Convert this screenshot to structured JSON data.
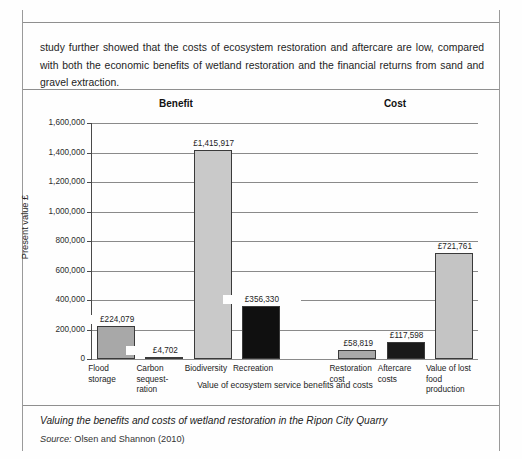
{
  "document": {
    "paragraph": "study further showed that the costs of ecosystem restoration and aftercare are low, compared with both the economic benefits of wetland restoration and the financial returns from sand and gravel extraction.",
    "caption": "Valuing the benefits and costs of wetland restoration in the Ripon City Quarry",
    "source_label": "Source:",
    "source_text": "Olsen and Shannon (2010)"
  },
  "chart_data": {
    "type": "bar",
    "title": "",
    "xlabel": "Value of ecosystem service benefits and costs",
    "ylabel": "Present value £",
    "ylim": [
      0,
      1600000
    ],
    "ytick_values": [
      0,
      200000,
      400000,
      600000,
      800000,
      1000000,
      1200000,
      1400000,
      1600000
    ],
    "ytick_labels": [
      "0",
      "200,000",
      "400,000",
      "600,000",
      "800,000",
      "1,000,000",
      "1,200,000",
      "1,400,000",
      "1,600,000"
    ],
    "grid": true,
    "legend": "none",
    "group_headings": [
      {
        "label": "Benefit"
      },
      {
        "label": "Cost"
      }
    ],
    "categories": [
      "Flood storage",
      "Carbon sequest-ration",
      "Biodiversity",
      "Recreation",
      "",
      "Restoration cost",
      "Aftercare costs",
      "Value of lost food production"
    ],
    "values": [
      224079,
      4702,
      1415917,
      356330,
      null,
      58819,
      117598,
      721761
    ],
    "bars": [
      {
        "category_lines": [
          "Flood",
          "storage"
        ],
        "value": 224079,
        "value_label": "£224,079",
        "color": "#a8a8a8",
        "group": "Benefit"
      },
      {
        "category_lines": [
          "Carbon",
          "sequest-",
          "ration"
        ],
        "value": 4702,
        "value_label": "£4,702",
        "color": "#c9c9c9",
        "group": "Benefit"
      },
      {
        "category_lines": [
          "Biodiversity"
        ],
        "value": 1415917,
        "value_label": "£1,415,917",
        "color": "#c9c9c9",
        "group": "Benefit"
      },
      {
        "category_lines": [
          "Recreation"
        ],
        "value": 356330,
        "value_label": "£356,330",
        "color": "#101010",
        "group": "Benefit"
      },
      {
        "category_lines": [
          "Restoration",
          "cost"
        ],
        "value": 58819,
        "value_label": "£58,819",
        "color": "#a8a8a8",
        "group": "Cost"
      },
      {
        "category_lines": [
          "Aftercare",
          "costs"
        ],
        "value": 117598,
        "value_label": "£117,598",
        "color": "#1a1a1a",
        "group": "Cost"
      },
      {
        "category_lines": [
          "Value of lost",
          "food",
          "production"
        ],
        "value": 721761,
        "value_label": "£721,761",
        "color": "#c4c4c4",
        "group": "Cost"
      }
    ]
  }
}
